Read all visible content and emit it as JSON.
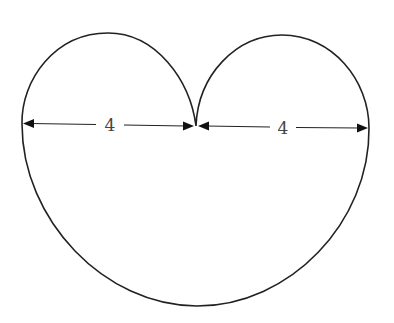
{
  "figure": {
    "stroke_color": "#222222",
    "background": "#ffffff"
  },
  "dimensions": [
    {
      "id": "left-width",
      "label": "4",
      "from": "left edge",
      "to": "cusp"
    },
    {
      "id": "right-width",
      "label": "4",
      "from": "cusp",
      "to": "right edge"
    }
  ]
}
